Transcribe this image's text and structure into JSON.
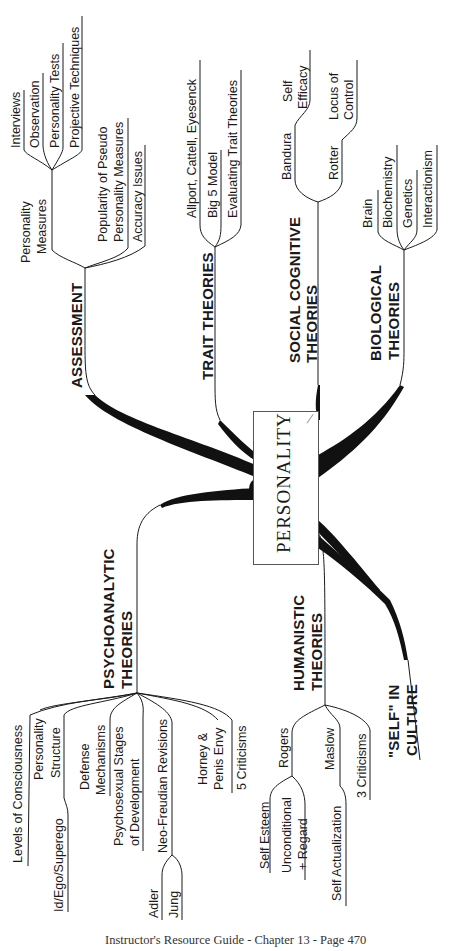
{
  "center_topic": "PERSONALITY",
  "branches": {
    "assessment": {
      "title": "ASSESSMENT",
      "personality_measures": {
        "label_line1": "Personality",
        "label_line2": "Measures",
        "children": [
          "Interviews",
          "Observation",
          "Personality Tests",
          "Projective Techniques"
        ]
      },
      "popularity": {
        "line1": "Popularity of Pseudo",
        "line2": "Personality Measures"
      },
      "accuracy": "Accuracy Issues"
    },
    "trait": {
      "title": "TRAIT THEORIES",
      "children": [
        "Allport, Cattell, Eyesenck",
        "Big 5 Model",
        "Evaluating Trait Theories"
      ]
    },
    "social_cognitive": {
      "title_line1": "SOCIAL COGNITIVE",
      "title_line2": "THEORIES",
      "bandura": {
        "label": "Bandura",
        "child_line1": "Self",
        "child_line2": "Efficacy"
      },
      "rotter": {
        "label": "Rotter",
        "child_line1": "Locus of",
        "child_line2": "Control"
      }
    },
    "biological": {
      "title_line1": "BIOLOGICAL",
      "title_line2": "THEORIES",
      "children": [
        "Brain",
        "Biochemistry",
        "Genetics",
        "Interactionism"
      ]
    },
    "psychoanalytic": {
      "title_line1": "PSYCHOANALYTIC",
      "title_line2": "THEORIES",
      "levels": "Levels of Consciousness",
      "structure": {
        "line1": "Personality",
        "line2": "Structure",
        "child": "Id/Ego/Superego"
      },
      "defense": {
        "line1": "Defense",
        "line2": "Mechanisms"
      },
      "psychosexual": {
        "line1": "Psychosexual Stages",
        "line2": "of Development"
      },
      "neo": {
        "label": "Neo-Freudian Revisions",
        "children": [
          "Adler",
          "Jung"
        ]
      },
      "horney": {
        "line1": "Horney &",
        "line2": "Penis Envy"
      },
      "criticisms": "5 Criticisms"
    },
    "humanistic": {
      "title_line1": "HUMANISTIC",
      "title_line2": "THEORIES",
      "rogers": {
        "label": "Rogers",
        "child1": "Self Esteem",
        "child2_line1": "Unconditional",
        "child2_line2": "+ Regard"
      },
      "maslow": {
        "label": "Maslow",
        "child": "Self Actualization"
      },
      "criticisms": "3 Criticisms"
    },
    "self_culture": {
      "title_line1": "\"SELF\" IN",
      "title_line2": "CULTURE"
    }
  },
  "footer": "Instructor's Resource Guide - Chapter 13 - Page 470",
  "colors": {
    "ink": "#1a1a1a",
    "background": "#ffffff",
    "box_border": "#555555"
  }
}
